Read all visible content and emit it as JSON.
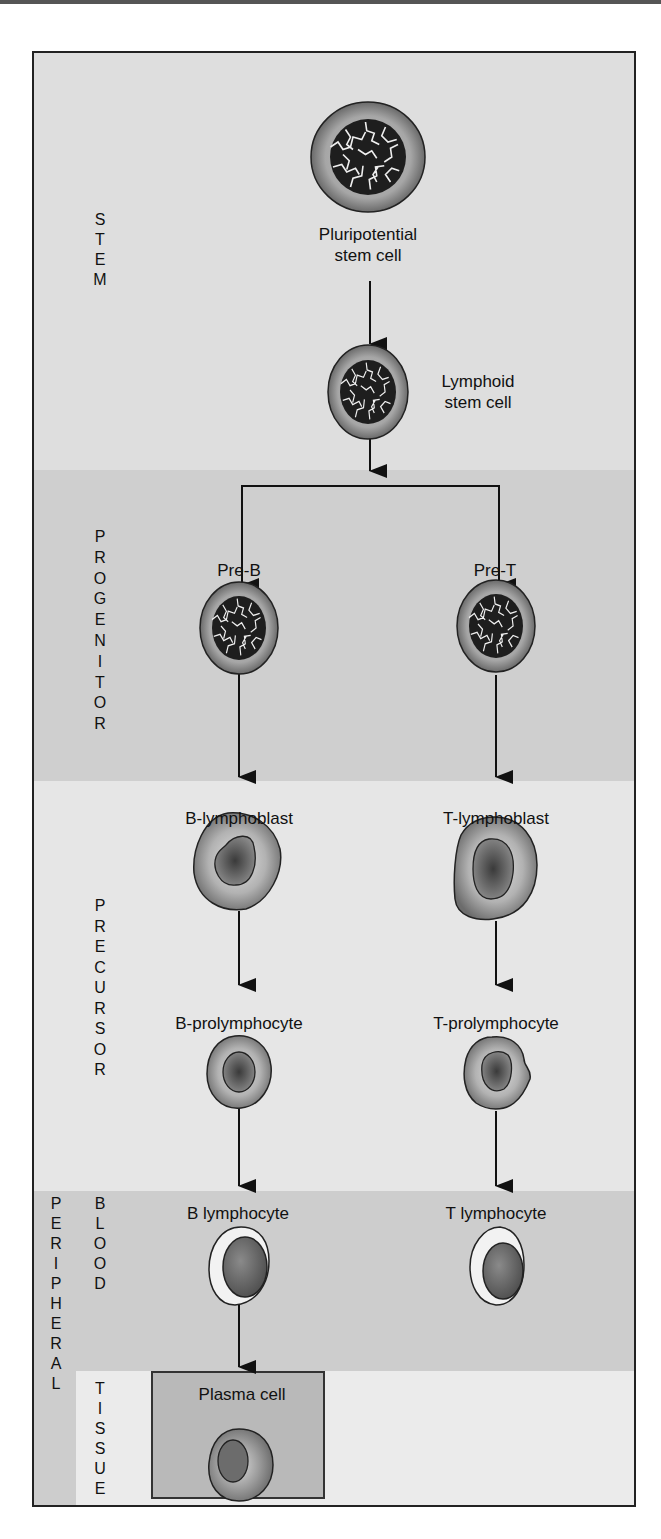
{
  "diagram": {
    "colors": {
      "stem_band": "#dedede",
      "progenitor_band": "#cfcfcf",
      "precursor_band": "#e6e6e6",
      "blood_band": "#cdcdcd",
      "tissue_band": "#ebebeb",
      "peripheral_column": "#cdcdcd",
      "plasma_box": "#b9b9b9",
      "frame_border": "#222222",
      "arrow": "#111111"
    },
    "bands": [
      {
        "id": "stem",
        "label": "STEM",
        "top": 0,
        "height": 417
      },
      {
        "id": "progenitor",
        "label": "PROGENITOR",
        "top": 417,
        "height": 311
      },
      {
        "id": "precursor",
        "label": "PRECURSOR",
        "top": 728,
        "height": 410
      },
      {
        "id": "blood",
        "label": "BLOOD",
        "top": 1138,
        "height": 180
      },
      {
        "id": "tissue",
        "label": "TISSUE",
        "top": 1318,
        "height": 138
      }
    ],
    "group_label": "PERIPHERAL",
    "band_labels_vertical": {
      "stem": "S\nT\nE\nM",
      "progenitor": "P\nR\nO\nG\nE\nN\nI\nT\nO\nR",
      "precursor": "P\nR\nE\nC\nU\nR\nS\nO\nR",
      "blood": "B\nL\nO\nO\nD",
      "tissue": "T\nI\nS\nS\nU\nE",
      "peripheral": "P\nE\nR\nI\nP\nH\nE\nR\nA\nL"
    },
    "nodes": [
      {
        "id": "pluripotential",
        "label": "Pluripotential\nstem cell",
        "type": "stem-cell"
      },
      {
        "id": "lymphoid",
        "label": "Lymphoid\nstem cell",
        "type": "stem-cell"
      },
      {
        "id": "pre_b",
        "label": "Pre-B",
        "type": "stem-cell"
      },
      {
        "id": "pre_t",
        "label": "Pre-T",
        "type": "stem-cell"
      },
      {
        "id": "b_lymphoblast",
        "label": "B-lymphoblast",
        "type": "blast"
      },
      {
        "id": "t_lymphoblast",
        "label": "T-lymphoblast",
        "type": "blast"
      },
      {
        "id": "b_prolymphocyte",
        "label": "B-prolymphocyte",
        "type": "prolymphocyte"
      },
      {
        "id": "t_prolymphocyte",
        "label": "T-prolymphocyte",
        "type": "prolymphocyte"
      },
      {
        "id": "b_lymphocyte",
        "label": "B lymphocyte",
        "type": "lymphocyte"
      },
      {
        "id": "t_lymphocyte",
        "label": "T lymphocyte",
        "type": "lymphocyte"
      },
      {
        "id": "plasma_cell",
        "label": "Plasma cell",
        "type": "plasma"
      }
    ],
    "edges": [
      [
        "pluripotential",
        "lymphoid"
      ],
      [
        "lymphoid",
        "pre_b"
      ],
      [
        "lymphoid",
        "pre_t"
      ],
      [
        "pre_b",
        "b_lymphoblast"
      ],
      [
        "pre_t",
        "t_lymphoblast"
      ],
      [
        "b_lymphoblast",
        "b_prolymphocyte"
      ],
      [
        "t_lymphoblast",
        "t_prolymphocyte"
      ],
      [
        "b_prolymphocyte",
        "b_lymphocyte"
      ],
      [
        "t_prolymphocyte",
        "t_lymphocyte"
      ],
      [
        "b_lymphocyte",
        "plasma_cell"
      ]
    ]
  }
}
